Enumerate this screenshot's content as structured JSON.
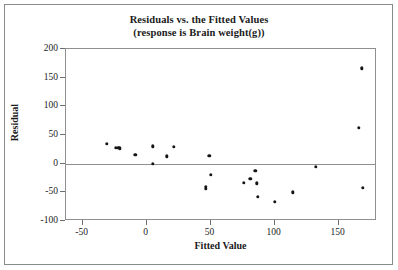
{
  "chart_data": {
    "type": "scatter",
    "title": "Residuals vs. the Fitted Values",
    "subtitle": "(response is Brain weight(g))",
    "xlabel": "Fitted Value",
    "ylabel": "Residual",
    "xlim": [
      -63,
      180
    ],
    "ylim": [
      -100,
      200
    ],
    "xticks": [
      -50,
      0,
      50,
      100,
      150
    ],
    "xticklabels": [
      "-50",
      "0",
      "50",
      "100",
      "150"
    ],
    "yticks": [
      -100,
      -50,
      0,
      50,
      100,
      150,
      200
    ],
    "yticklabels": [
      "-100",
      "-50",
      "0",
      "50",
      "100",
      "150",
      "200"
    ],
    "grid": false,
    "legend": null,
    "reference_line": {
      "axis": "y",
      "value": 0
    },
    "points": [
      {
        "x": -31,
        "y": 35
      },
      {
        "x": -24,
        "y": 28
      },
      {
        "x": -22,
        "y": 28
      },
      {
        "x": -21,
        "y": 27
      },
      {
        "x": -9,
        "y": 15
      },
      {
        "x": 5,
        "y": 30
      },
      {
        "x": 5,
        "y": 0
      },
      {
        "x": 16,
        "y": 13
      },
      {
        "x": 21,
        "y": 29
      },
      {
        "x": 46,
        "y": -40
      },
      {
        "x": 46,
        "y": -44
      },
      {
        "x": 49,
        "y": 14
      },
      {
        "x": 50,
        "y": -19
      },
      {
        "x": 76,
        "y": -33
      },
      {
        "x": 81,
        "y": -26
      },
      {
        "x": 85,
        "y": -12
      },
      {
        "x": 86,
        "y": -34
      },
      {
        "x": 87,
        "y": -58
      },
      {
        "x": 100,
        "y": -67
      },
      {
        "x": 114,
        "y": -50
      },
      {
        "x": 132,
        "y": -5
      },
      {
        "x": 166,
        "y": 63
      },
      {
        "x": 168,
        "y": 166
      },
      {
        "x": 169,
        "y": -42
      }
    ]
  }
}
